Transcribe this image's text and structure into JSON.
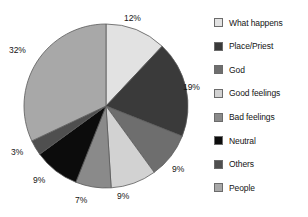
{
  "chart_data": {
    "type": "pie",
    "title": "",
    "categories": [
      "What happens",
      "Place/Priest",
      "God",
      "Good feelings",
      "Bad feelings",
      "Neutral",
      "Others",
      "People"
    ],
    "values": [
      12,
      19,
      9,
      9,
      7,
      9,
      3,
      32
    ],
    "labels": [
      "12%",
      "19%",
      "9%",
      "9%",
      "7%",
      "9%",
      "3%",
      "32%"
    ],
    "colors": [
      "#e2e2e2",
      "#3a3a3a",
      "#6e6e6e",
      "#d2d2d2",
      "#8a8a8a",
      "#0c0c0c",
      "#4f4f4f",
      "#a8a8a8"
    ],
    "start_angle": 0,
    "direction": "clockwise",
    "legend_position": "right",
    "grid": false,
    "units": "percent"
  },
  "legend": {
    "items": [
      {
        "label": "What happens",
        "color": "#e2e2e2"
      },
      {
        "label": "Place/Priest",
        "color": "#3a3a3a"
      },
      {
        "label": "God",
        "color": "#6e6e6e"
      },
      {
        "label": "Good feelings",
        "color": "#d2d2d2"
      },
      {
        "label": "Bad feelings",
        "color": "#8a8a8a"
      },
      {
        "label": "Neutral",
        "color": "#0c0c0c"
      },
      {
        "label": "Others",
        "color": "#4f4f4f"
      },
      {
        "label": "People",
        "color": "#a8a8a8"
      }
    ]
  },
  "pie_labels": [
    {
      "text": "12%",
      "left": 124,
      "top": 14
    },
    {
      "text": "19%",
      "left": 183,
      "top": 83
    },
    {
      "text": "9%",
      "left": 172,
      "top": 165
    },
    {
      "text": "9%",
      "left": 117,
      "top": 192
    },
    {
      "text": "7%",
      "left": 75,
      "top": 196
    },
    {
      "text": "9%",
      "left": 33,
      "top": 176
    },
    {
      "text": "3%",
      "left": 11,
      "top": 148
    },
    {
      "text": "32%",
      "left": 9,
      "top": 46
    }
  ]
}
